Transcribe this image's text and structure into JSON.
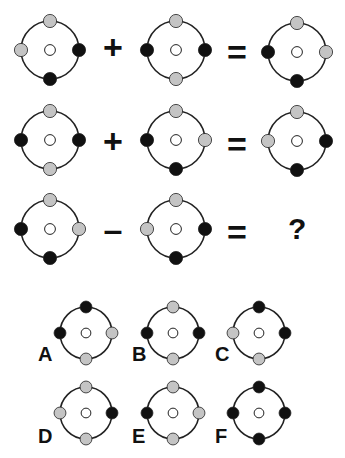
{
  "colors": {
    "black": "#111111",
    "gray": "#c4c4c4",
    "ring": "#222222",
    "center": "#ffffff"
  },
  "equations": [
    {
      "operator": "+",
      "equals": "=",
      "left": {
        "top": "gray",
        "left": "gray",
        "right": "black",
        "bottom": "black"
      },
      "right": {
        "top": "gray",
        "left": "black",
        "right": "black",
        "bottom": "gray"
      },
      "result": {
        "top": "gray",
        "left": "black",
        "right": "gray",
        "bottom": "black"
      }
    },
    {
      "operator": "+",
      "equals": "=",
      "left": {
        "top": "gray",
        "left": "black",
        "right": "black",
        "bottom": "gray"
      },
      "right": {
        "top": "gray",
        "left": "black",
        "right": "gray",
        "bottom": "black"
      },
      "result": {
        "top": "gray",
        "left": "gray",
        "right": "black",
        "bottom": "black"
      }
    },
    {
      "operator": "–",
      "equals": "=",
      "left": {
        "top": "gray",
        "left": "black",
        "right": "gray",
        "bottom": "black"
      },
      "right": {
        "top": "gray",
        "left": "gray",
        "right": "black",
        "bottom": "black"
      },
      "result": "?"
    }
  ],
  "options": [
    {
      "label": "A",
      "dots": {
        "top": "black",
        "left": "black",
        "right": "gray",
        "bottom": "gray"
      }
    },
    {
      "label": "B",
      "dots": {
        "top": "gray",
        "left": "black",
        "right": "black",
        "bottom": "gray"
      }
    },
    {
      "label": "C",
      "dots": {
        "top": "black",
        "left": "gray",
        "right": "black",
        "bottom": "gray"
      }
    },
    {
      "label": "D",
      "dots": {
        "top": "gray",
        "left": "gray",
        "right": "black",
        "bottom": "gray"
      }
    },
    {
      "label": "E",
      "dots": {
        "top": "gray",
        "left": "black",
        "right": "gray",
        "bottom": "gray"
      }
    },
    {
      "label": "F",
      "dots": {
        "top": "black",
        "left": "black",
        "right": "black",
        "bottom": "black"
      }
    }
  ]
}
